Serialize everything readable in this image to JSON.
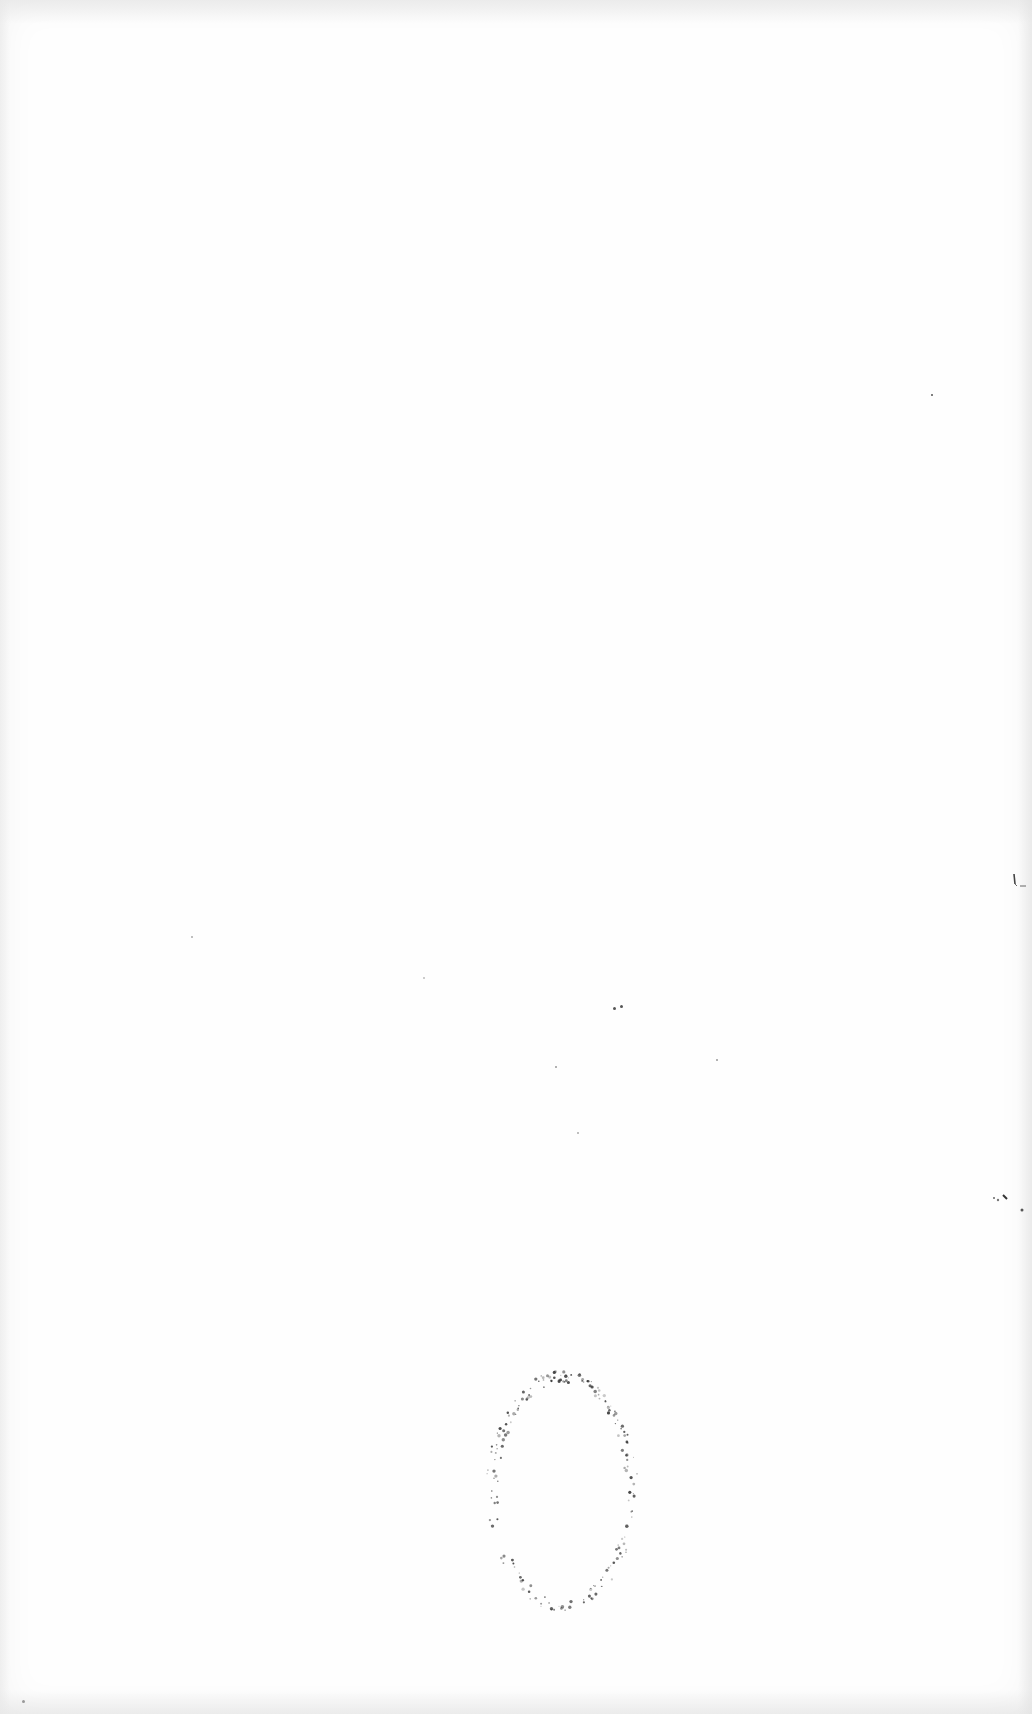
{
  "document": {
    "type": "blank scanned page",
    "text": "",
    "stamp": {
      "shape": "oval",
      "style": "faint dotted impression",
      "color": "#333333",
      "text": ""
    }
  }
}
